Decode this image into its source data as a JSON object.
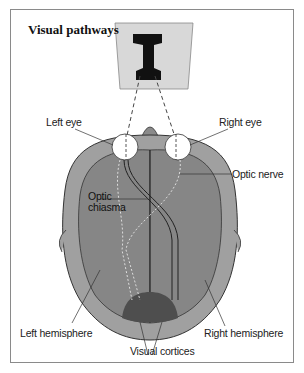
{
  "title": "Visual pathways",
  "object_letter": "I",
  "labels": {
    "left_eye": "Left eye",
    "right_eye": "Right eye",
    "optic_nerve": "Optic nerve",
    "optic_chiasma_1": "Optic",
    "optic_chiasma_2": "chiasma",
    "left_hemisphere": "Left hemisphere",
    "right_hemisphere": "Right hemisphere",
    "visual_cortices": "Visual cortices"
  },
  "colors": {
    "head": "#9a9a9a",
    "brain": "#858585",
    "cortex": "#505050",
    "card": "#d9d9d9",
    "eye": "#ffffff"
  }
}
